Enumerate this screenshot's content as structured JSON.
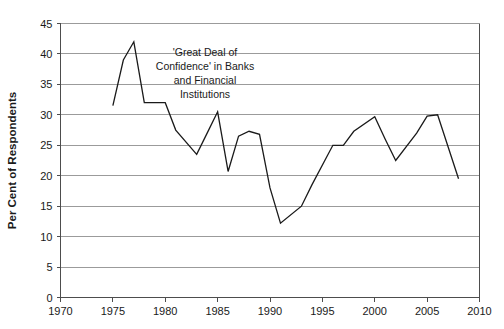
{
  "chart_data": {
    "type": "line",
    "title": "",
    "xlabel": "",
    "ylabel": "Per Cent of Respondents",
    "xlim": [
      1970,
      2010
    ],
    "ylim": [
      0,
      45
    ],
    "xticks": [
      1970,
      1975,
      1980,
      1985,
      1990,
      1995,
      2000,
      2005,
      2010
    ],
    "yticks": [
      0,
      5,
      10,
      15,
      20,
      25,
      30,
      35,
      40,
      45
    ],
    "grid": true,
    "legend": "none",
    "annotations": [
      {
        "name": "series-label",
        "lines": [
          "'Great Deal of",
          "Confidence' in Banks",
          "and Financial",
          "Institutions"
        ],
        "x": 1985,
        "y": 38
      }
    ],
    "series": [
      {
        "name": "'Great Deal of Confidence' in Banks and Financial Institutions",
        "color": "#1a1a1a",
        "x": [
          1975,
          1976,
          1977,
          1978,
          1979,
          1980,
          1981,
          1983,
          1984,
          1985,
          1986,
          1987,
          1988,
          1989,
          1990,
          1991,
          1993,
          1994,
          1996,
          1997,
          1998,
          2000,
          2001,
          2002,
          2004,
          2005,
          2006,
          2008
        ],
        "y": [
          31.5,
          39.0,
          42.0,
          32.0,
          32.0,
          32.0,
          27.5,
          23.5,
          27.0,
          30.5,
          20.7,
          26.5,
          27.3,
          26.8,
          18.0,
          12.2,
          15.0,
          18.5,
          25.0,
          25.0,
          27.3,
          29.7,
          26.0,
          22.5,
          27.0,
          29.8,
          30.0,
          19.5
        ]
      }
    ]
  },
  "axis": {
    "y_tick_labels": [
      "0",
      "5",
      "10",
      "15",
      "20",
      "25",
      "30",
      "35",
      "40",
      "45"
    ],
    "x_tick_labels": [
      "1970",
      "1975",
      "1980",
      "1985",
      "1990",
      "1995",
      "2000",
      "2005",
      "2010"
    ],
    "y_title": "Per Cent of Respondents"
  },
  "annotation": {
    "line1": "'Great Deal of",
    "line2": "Confidence' in Banks",
    "line3": "and Financial",
    "line4": "Institutions"
  }
}
